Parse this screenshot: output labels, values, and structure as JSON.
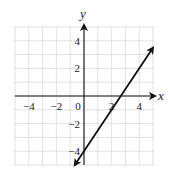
{
  "chart_data": {
    "type": "line",
    "title": "",
    "xlabel": "x",
    "ylabel": "y",
    "xlim": [
      -5,
      5
    ],
    "ylim": [
      -5,
      5
    ],
    "grid": true,
    "grid_step": 1,
    "x_ticks": [
      -4,
      -2,
      0,
      2,
      4
    ],
    "x_tick_labels": [
      "−4",
      "−2",
      "0",
      "2",
      "4"
    ],
    "y_ticks": [
      4,
      2,
      -2,
      -4
    ],
    "y_tick_labels": [
      "4",
      "2",
      "−2",
      "−4"
    ],
    "series": [
      {
        "name": "y = 1.5x - 4",
        "equation": "y = (3/2)x - 4",
        "slope": 1.5,
        "intercept": -4,
        "x": [
          -0.67,
          5
        ],
        "y": [
          -5,
          3.5
        ],
        "arrows": "both"
      }
    ],
    "colors": {
      "grid": "#c8c8c8",
      "axis": "#111111",
      "line": "#111111"
    }
  }
}
